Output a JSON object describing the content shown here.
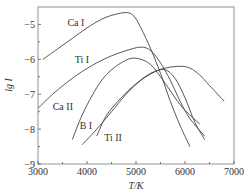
{
  "chart_data": {
    "type": "line",
    "title": "",
    "xlabel": "T/K",
    "ylabel": "lg I",
    "xlim": [
      3000,
      7000
    ],
    "ylim": [
      -9,
      -4.5
    ],
    "x_ticks": [
      3000,
      4000,
      5000,
      6000,
      7000
    ],
    "x_tick_labels": [
      "3000",
      "4000",
      "5000",
      "6000",
      "7000"
    ],
    "x_minor_ticks": [
      3500,
      4500,
      5500,
      6500
    ],
    "y_ticks": [
      -5,
      -6,
      -7,
      -8,
      -9
    ],
    "y_tick_labels": [
      "-5",
      "-6",
      "-7",
      "-8",
      "-9"
    ],
    "y_minor_ticks": [
      -5.5,
      -6.5,
      -7.5,
      -8.5
    ],
    "grid": false,
    "legend": "inline labels",
    "series": [
      {
        "name": "Ca I",
        "label_pos": [
          3600,
          -5.05
        ],
        "x": [
          3100,
          3400,
          3700,
          4000,
          4300,
          4550,
          4800,
          4950,
          5100,
          5300,
          5500,
          5700,
          5900,
          6100
        ],
        "values": [
          -6.0,
          -5.7,
          -5.4,
          -5.1,
          -4.85,
          -4.72,
          -4.66,
          -4.75,
          -5.1,
          -5.7,
          -6.4,
          -7.2,
          -7.9,
          -8.5
        ]
      },
      {
        "name": "Ti I",
        "label_pos": [
          3750,
          -6.1
        ],
        "x": [
          3000,
          3300,
          3600,
          3900,
          4200,
          4500,
          4800,
          5100,
          5300,
          5500,
          5700,
          5900,
          6100,
          6400
        ],
        "values": [
          -7.4,
          -7.0,
          -6.65,
          -6.35,
          -6.1,
          -5.9,
          -5.75,
          -5.65,
          -5.75,
          -6.1,
          -6.6,
          -7.2,
          -7.7,
          -8.2
        ]
      },
      {
        "name": "Ca II",
        "label_pos": [
          3300,
          -7.45
        ],
        "x": [
          3700,
          3900,
          4100,
          4300,
          4500,
          4700,
          4900,
          5100,
          5300,
          5500,
          5700,
          5900,
          6100,
          6300
        ],
        "values": [
          -8.3,
          -7.6,
          -7.05,
          -6.6,
          -6.3,
          -6.1,
          -5.97,
          -6.0,
          -6.15,
          -6.5,
          -6.9,
          -7.3,
          -7.6,
          -7.85
        ]
      },
      {
        "name": "B I",
        "label_pos": [
          3850,
          -8.0
        ],
        "x": [
          3900,
          4200,
          4500,
          4800,
          5100,
          5400,
          5600,
          5800,
          6000,
          6200,
          6400
        ],
        "values": [
          -8.45,
          -8.0,
          -7.5,
          -7.0,
          -6.6,
          -6.35,
          -6.3,
          -6.55,
          -7.1,
          -7.8,
          -8.3
        ]
      },
      {
        "name": "Ti II",
        "label_pos": [
          4350,
          -8.35
        ],
        "x": [
          4200,
          4400,
          4700,
          5000,
          5300,
          5600,
          5900,
          6100,
          6300,
          6500,
          6800
        ],
        "values": [
          -8.2,
          -7.6,
          -7.1,
          -6.7,
          -6.4,
          -6.25,
          -6.2,
          -6.25,
          -6.45,
          -6.75,
          -7.2
        ]
      }
    ]
  }
}
